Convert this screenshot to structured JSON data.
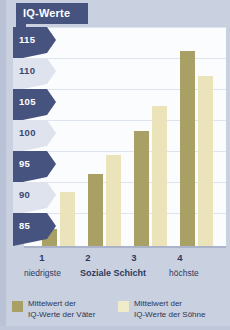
{
  "chart_data": {
    "type": "bar",
    "title": "IQ-Werte",
    "xlabel": "Soziale Schicht",
    "ylabel": "IQ-Werte",
    "categories": [
      "1",
      "2",
      "3",
      "4"
    ],
    "category_notes": {
      "lowest": "niedrigste",
      "highest": "höchste"
    },
    "series": [
      {
        "name": "Mittelwert der IQ-Werte der Väter",
        "color": "#a8a065",
        "values": [
          84,
          93,
          100,
          113
        ]
      },
      {
        "name": "Mittelwert der IQ-Werte der Söhne",
        "color": "#ebe4ba",
        "values": [
          90,
          96,
          104,
          109
        ]
      }
    ],
    "ylim": [
      81,
      117
    ],
    "yticks": [
      85,
      90,
      95,
      100,
      105,
      110,
      115
    ],
    "ytick_labels": [
      "85",
      "90",
      "95",
      "100",
      "105",
      "110",
      "115"
    ],
    "grid": true,
    "legend_position": "bottom"
  },
  "header": {
    "title": "IQ-Werte"
  },
  "axis": {
    "y_labels": [
      "115",
      "110",
      "105",
      "100",
      "95",
      "90",
      "85"
    ],
    "x_labels": [
      "1",
      "2",
      "3",
      "4"
    ],
    "x_caption_left": "niedrigste",
    "x_caption_center": "Soziale Schicht",
    "x_caption_right": "höchste"
  },
  "legend": {
    "items": [
      {
        "label_line1": "Mittelwert der",
        "label_line2": "IQ-Werte der Väter",
        "color": "#a8a065"
      },
      {
        "label_line1": "Mittelwert der",
        "label_line2": "IQ-Werte der Söhne",
        "color": "#f0ecc9"
      }
    ]
  },
  "colors": {
    "background": "#c9d0e0",
    "panel": "#fbfcfe",
    "banner": "#46537f",
    "tab_light": "#dfe3ee",
    "bar_fathers": "#a8a065",
    "bar_sons": "#ebe4ba"
  }
}
